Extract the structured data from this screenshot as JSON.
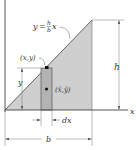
{
  "diagram": {
    "type": "centroid-triangle-area",
    "colors": {
      "triangle_fill": "#cfcfcf",
      "strip_fill": "#b3b3b3",
      "line": "#444444",
      "dimension_line": "#777777",
      "text": "#333333",
      "background": "#ffffff"
    },
    "axes": {
      "x_label": "x",
      "y_label": "y"
    },
    "curve_label": {
      "y": "y",
      "equals": "=",
      "numerator": "h",
      "denominator": "b",
      "x": "x"
    },
    "point_label": "(x,y)",
    "centroid_label": "(x̄,ȳ)",
    "strip_height_label": "y",
    "height_label": "h",
    "strip_width_label": "dx",
    "base_label": "b"
  }
}
